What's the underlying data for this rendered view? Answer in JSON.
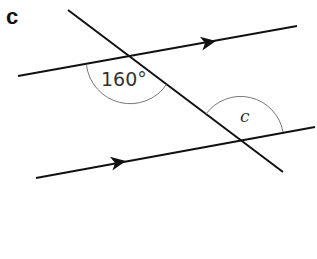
{
  "part_label": "c",
  "angles": {
    "given": "160°",
    "unknown": "c"
  },
  "figure": {
    "type": "parallel lines cut by a transversal",
    "parallel_arrows": "right-pointing",
    "line_color": "#111111",
    "arc_color": "#777777"
  }
}
